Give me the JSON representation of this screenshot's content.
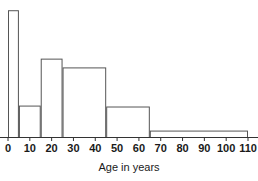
{
  "chart_data": {
    "type": "bar",
    "title": "",
    "subtitle": "",
    "xlabel": "Age in years",
    "ylabel": "",
    "xlim": [
      0,
      110
    ],
    "ylim": [
      0,
      1
    ],
    "grid": false,
    "legend": null,
    "xticks": [
      0,
      10,
      20,
      30,
      40,
      50,
      60,
      70,
      80,
      90,
      100,
      110
    ],
    "xtick_labels": [
      "0",
      "10",
      "20",
      "30",
      "40",
      "50",
      "60",
      "70",
      "80",
      "90",
      "100",
      "110"
    ],
    "yticks": [],
    "ytick_labels": [],
    "bin_edges": [
      0,
      5,
      15,
      25,
      45,
      65,
      110
    ],
    "bin_labels": [
      "0-5",
      "5-15",
      "15-25",
      "25-45",
      "45-65",
      "65-110"
    ],
    "bin_widths": [
      5,
      10,
      10,
      20,
      20,
      45
    ],
    "values": [
      0.957,
      0.24,
      0.593,
      0.527,
      0.233,
      0.052
    ],
    "categories": [
      "0-5",
      "5-15",
      "15-25",
      "25-45",
      "45-65",
      "65-110"
    ],
    "bar_color": "#ffffff",
    "bar_edge_color": "#555555",
    "axis_color": "#333333",
    "background_color": "#ffffff",
    "annotations": []
  },
  "axis": {
    "title": "Age in years"
  },
  "colors": {
    "bar_fill": "#ffffff",
    "bar_stroke": "#555555",
    "axis": "#333333",
    "text": "#1a1a1a",
    "background": "#ffffff"
  }
}
